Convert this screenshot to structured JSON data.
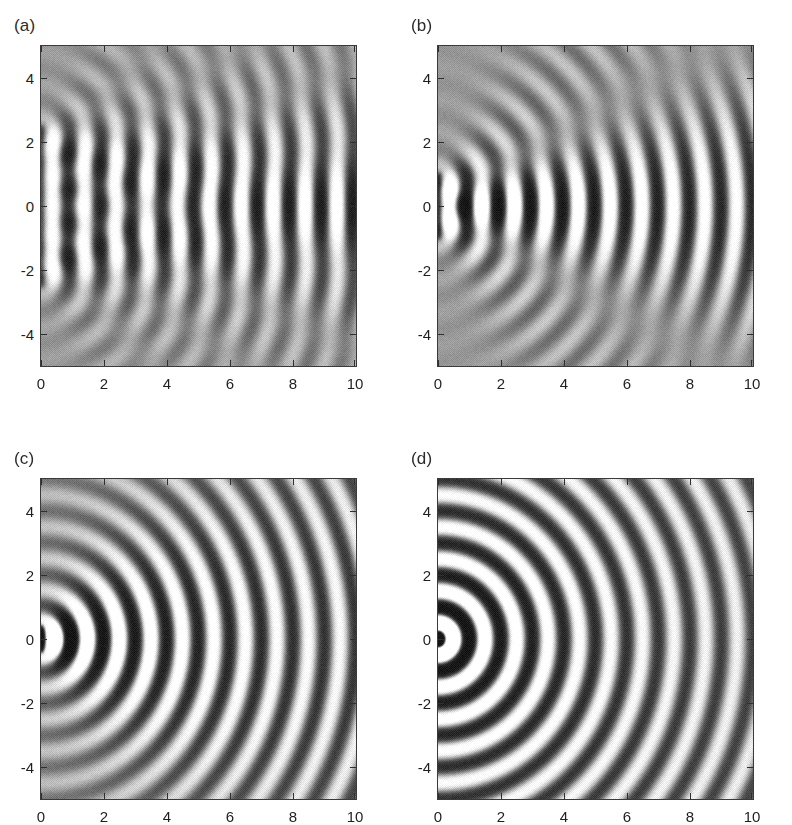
{
  "figure": {
    "width": 792,
    "height": 825,
    "background": "#ffffff",
    "layout": "2x2 grid of grayscale wave-field images",
    "colormap": "grayscale",
    "background_gray": "#9a9a9a"
  },
  "chart_data": [
    {
      "type": "heatmap",
      "panel": "a",
      "label": "(a)",
      "title": "",
      "xlabel": "",
      "ylabel": "",
      "xlim": [
        0,
        10
      ],
      "ylim": [
        -5,
        5
      ],
      "xticks": [
        0,
        2,
        4,
        6,
        8,
        10
      ],
      "xticklabels": [
        "0",
        "2",
        "4",
        "6",
        "8",
        "10"
      ],
      "yticks": [
        -4,
        -2,
        0,
        2,
        4
      ],
      "yticklabels": [
        "-4",
        "-2",
        "0",
        "2",
        "4"
      ],
      "grid": false,
      "legend": false,
      "field": "wave amplitude radiated from a finite aperture at x=0",
      "source_half_width": 2.5,
      "wavelength": 1.0,
      "wavenumber": 6.2832,
      "fringes_along_axis": 10,
      "description": "Wide aperture: nearly plane wavefronts, strong vertical fringes confined to |y| < 2.5, weak curvature at large x",
      "value_range": [
        -1,
        1
      ]
    },
    {
      "type": "heatmap",
      "panel": "b",
      "label": "(b)",
      "title": "",
      "xlabel": "",
      "ylabel": "",
      "xlim": [
        0,
        10
      ],
      "ylim": [
        -5,
        5
      ],
      "xticks": [
        0,
        2,
        4,
        6,
        8,
        10
      ],
      "xticklabels": [
        "0",
        "2",
        "4",
        "6",
        "8",
        "10"
      ],
      "yticks": [
        -4,
        -2,
        0,
        2,
        4
      ],
      "yticklabels": [
        "-4",
        "-2",
        "0",
        "2",
        "4"
      ],
      "grid": false,
      "legend": false,
      "field": "wave amplitude radiated from a finite aperture at x=0",
      "source_half_width": 1.0,
      "wavelength": 1.0,
      "wavenumber": 6.2832,
      "fringes_along_axis": 10,
      "description": "Narrower aperture: clearly curved wavefronts spreading from a compact source near y=0",
      "value_range": [
        -1,
        1
      ]
    },
    {
      "type": "heatmap",
      "panel": "c",
      "label": "(c)",
      "title": "",
      "xlabel": "",
      "ylabel": "",
      "xlim": [
        0,
        10
      ],
      "ylim": [
        -5,
        5
      ],
      "xticks": [
        0,
        2,
        4,
        6,
        8,
        10
      ],
      "xticklabels": [
        "0",
        "2",
        "4",
        "6",
        "8",
        "10"
      ],
      "yticks": [
        -4,
        -2,
        0,
        2,
        4
      ],
      "yticklabels": [
        "-4",
        "-2",
        "0",
        "2",
        "4"
      ],
      "grid": false,
      "legend": false,
      "field": "wave amplitude radiated from a finite aperture at x=0",
      "source_half_width": 0.4,
      "wavelength": 1.0,
      "wavenumber": 6.2832,
      "fringes_along_axis": 10,
      "description": "Small source: near-circular wavefronts, amplitude decaying with radius",
      "value_range": [
        -1,
        1
      ]
    },
    {
      "type": "heatmap",
      "panel": "d",
      "label": "(d)",
      "title": "",
      "xlabel": "",
      "ylabel": "",
      "xlim": [
        0,
        10
      ],
      "ylim": [
        -5,
        5
      ],
      "xticks": [
        0,
        2,
        4,
        6,
        8,
        10
      ],
      "xticklabels": [
        "0",
        "2",
        "4",
        "6",
        "8",
        "10"
      ],
      "yticks": [
        -4,
        -2,
        0,
        2,
        4
      ],
      "yticklabels": [
        "-4",
        "-2",
        "0",
        "2",
        "4"
      ],
      "grid": false,
      "legend": false,
      "field": "wave amplitude radiated from a point source at the origin",
      "source_half_width": 0.12,
      "wavelength": 1.0,
      "wavenumber": 6.2832,
      "fringes_along_axis": 10,
      "description": "Point source: fully circular wavefronts filling the domain",
      "value_range": [
        -1,
        1
      ]
    }
  ],
  "panels": [
    {
      "id": "a",
      "label": "(a)",
      "box": {
        "left": 40,
        "top": 45,
        "width": 315,
        "height": 320
      },
      "label_pos": {
        "left": 14,
        "top": 16
      }
    },
    {
      "id": "b",
      "label": "(b)",
      "box": {
        "left": 437,
        "top": 45,
        "width": 315,
        "height": 320
      },
      "label_pos": {
        "left": 411,
        "top": 16
      }
    },
    {
      "id": "c",
      "label": "(c)",
      "box": {
        "left": 40,
        "top": 478,
        "width": 315,
        "height": 320
      },
      "label_pos": {
        "left": 14,
        "top": 449
      }
    },
    {
      "id": "d",
      "label": "(d)",
      "box": {
        "left": 437,
        "top": 478,
        "width": 315,
        "height": 320
      },
      "label_pos": {
        "left": 411,
        "top": 449
      }
    }
  ]
}
